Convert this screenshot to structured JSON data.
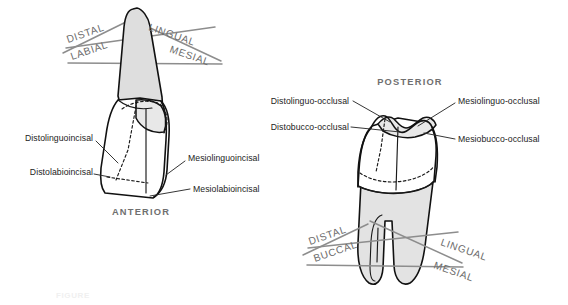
{
  "figure": {
    "background_color": "#ffffff",
    "ink_color": "#111111",
    "root_fill_color": "#dedede",
    "crown_fill_color": "#ffffff",
    "plane_label_color": "#6b6b6b",
    "arch_label_color": "#6f6f6f"
  },
  "anterior": {
    "arch_label": "ANTERIOR",
    "plane_labels": [
      {
        "id": "distal",
        "text": "DISTAL",
        "rotation": -19
      },
      {
        "id": "lingual",
        "text": "LINGUAL",
        "rotation": 19
      },
      {
        "id": "labial",
        "text": "LABIAL",
        "rotation": -19
      },
      {
        "id": "mesial",
        "text": "MESIAL",
        "rotation": 19
      }
    ],
    "line_angles": [
      {
        "id": "distolinguoincisal",
        "text": "Distolinguoincisal",
        "side": "left"
      },
      {
        "id": "distolabioincisal",
        "text": "Distolabioincisal",
        "side": "left"
      },
      {
        "id": "mesiolinguoincisal",
        "text": "Mesiolinguoincisal",
        "side": "right"
      },
      {
        "id": "mesiolabioincisal",
        "text": "Mesiolabioincisal",
        "side": "right"
      }
    ]
  },
  "posterior": {
    "arch_label": "POSTERIOR",
    "plane_labels": [
      {
        "id": "distal",
        "text": "DISTAL",
        "rotation": -19
      },
      {
        "id": "lingual",
        "text": "LINGUAL",
        "rotation": 19
      },
      {
        "id": "buccal",
        "text": "BUCCAL",
        "rotation": -19
      },
      {
        "id": "mesial",
        "text": "MESIAL",
        "rotation": 19
      }
    ],
    "line_angles": [
      {
        "id": "distolinguo-occlusal",
        "text": "Distolinguo-occlusal",
        "side": "left"
      },
      {
        "id": "distobucco-occlusal",
        "text": "Distobucco-occlusal",
        "side": "left"
      },
      {
        "id": "mesiolinguo-occlusal",
        "text": "Mesiolinguo-occlusal",
        "side": "right"
      },
      {
        "id": "mesiobucco-occlusal",
        "text": "Mesiobucco-occlusal",
        "side": "right"
      }
    ]
  },
  "caption": {
    "partial_text": "FIGURE"
  }
}
